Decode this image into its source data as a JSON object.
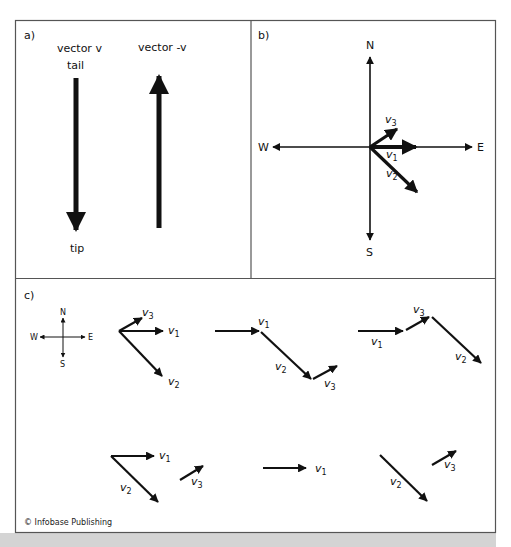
{
  "panels": {
    "a": {
      "label": "a)",
      "vector_v_label": "vector v",
      "vector_neg_v_label": "vector -v",
      "tail_label": "tail",
      "tip_label": "tip"
    },
    "b": {
      "label": "b)",
      "compass": {
        "n": "N",
        "s": "S",
        "e": "E",
        "w": "W"
      },
      "vectors": [
        {
          "name": "v",
          "sub": "1"
        },
        {
          "name": "v",
          "sub": "2"
        },
        {
          "name": "v",
          "sub": "3"
        }
      ]
    },
    "c": {
      "label": "c)",
      "compass": {
        "n": "N",
        "s": "S",
        "e": "E",
        "w": "W"
      },
      "v": "v",
      "sub1": "1",
      "sub2": "2",
      "sub3": "3"
    }
  },
  "copyright": "© Infobase Publishing",
  "colors": {
    "stroke": "#111111",
    "frame": "#555555",
    "band": "#d4d4d4"
  }
}
